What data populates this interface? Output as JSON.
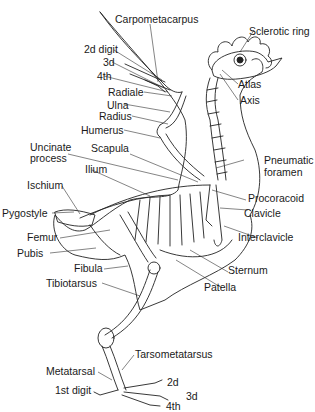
{
  "diagram": {
    "labels": {
      "carpometacarpus": "Carpometacarpus",
      "sclerotic_ring": "Sclerotic ring",
      "digit2_wing": "2d digit",
      "digit3_wing": "3d",
      "digit4_wing": "4th",
      "radiale": "Radiale",
      "ulna": "Ulna",
      "radius": "Radius",
      "humerus": "Humerus",
      "atlas": "Atlas",
      "axis": "Axis",
      "uncinate_process_1": "Uncinate",
      "uncinate_process_2": "process",
      "scapula": "Scapula",
      "ilium": "Ilium",
      "pneumatic_foramen_1": "Pneumatic",
      "pneumatic_foramen_2": "foramen",
      "ischium": "Ischium",
      "procoracoid": "Procoracoid",
      "pygostyle": "Pygostyle",
      "clavicle": "Clavicle",
      "interclavicle": "Interclavicle",
      "femur": "Femur",
      "pubis": "Pubis",
      "sternum": "Sternum",
      "patella": "Patella",
      "fibula": "Fibula",
      "tibiotarsus": "Tibiotarsus",
      "tarsometatarsus": "Tarsometatarsus",
      "metatarsal": "Metatarsal",
      "digit2_foot": "2d",
      "digit1_foot": "1st digit",
      "digit3_foot": "3d",
      "digit4_foot": "4th"
    },
    "colors": {
      "line": "#222222",
      "text": "#1a1a1a",
      "background": "#ffffff"
    }
  }
}
